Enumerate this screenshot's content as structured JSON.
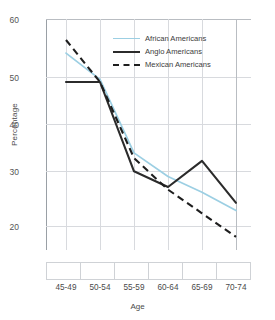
{
  "chart_data": {
    "type": "line",
    "title": "",
    "xlabel": "Age",
    "ylabel": "Percentage",
    "categories": [
      "45-49",
      "50-54",
      "55-59",
      "60-64",
      "65-69",
      "70-74"
    ],
    "yticks": [
      20,
      30,
      40,
      50,
      60
    ],
    "ylim": [
      17,
      61
    ],
    "grid": true,
    "legend_position": "top-center",
    "series": [
      {
        "name": "African Americans",
        "style": "solid",
        "color": "#9ccfe3",
        "values": [
          54.5,
          49.5,
          35.5,
          31.0,
          28.0,
          24.5
        ]
      },
      {
        "name": "Anglo Americans",
        "style": "solid",
        "color": "#2b2b2b",
        "values": [
          49.0,
          49.0,
          32.0,
          29.0,
          34.0,
          26.0
        ]
      },
      {
        "name": "Mexican Americans",
        "style": "dashed",
        "color": "#1e1e1e",
        "values": [
          57.0,
          49.0,
          34.5,
          28.5,
          24.0,
          19.5
        ]
      }
    ]
  },
  "axis": {
    "y_title": "Percentage",
    "x_title": "Age",
    "y_tick_labels": [
      "60",
      "50",
      "40",
      "30",
      "20"
    ],
    "x_tick_labels": [
      "45-49",
      "50-54",
      "55-59",
      "60-64",
      "65-69",
      "70-74"
    ]
  },
  "legend": {
    "items": [
      {
        "label": "African Americans",
        "swatch": "line-solid-blue-swatch"
      },
      {
        "label": "Anglo Americans",
        "swatch": "line-solid-black-swatch"
      },
      {
        "label": "Mexican Americans",
        "swatch": "line-dashed-black-swatch"
      }
    ]
  }
}
